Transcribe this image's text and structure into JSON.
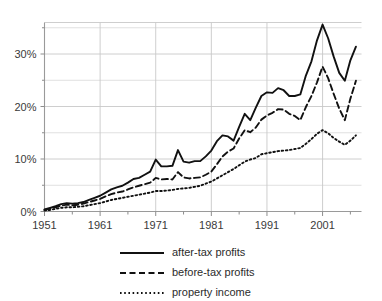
{
  "chart_data": {
    "type": "line",
    "title": "",
    "subtitle": "",
    "xlabel": "",
    "ylabel": "",
    "xlim": [
      1951,
      2008
    ],
    "ylim": [
      0,
      36
    ],
    "grid": true,
    "legend_position": "bottom",
    "x_tick_labels": [
      "1951",
      "1961",
      "1971",
      "1981",
      "1991",
      "2001"
    ],
    "x_ticks": [
      1951,
      1961,
      1971,
      1981,
      1991,
      2001
    ],
    "x_minor_ticks": [
      1956,
      1966,
      1976,
      1986,
      1996,
      2006
    ],
    "y_tick_labels": [
      "0%",
      "10%",
      "20%",
      "30%"
    ],
    "y_ticks": [
      0,
      10,
      20,
      30
    ],
    "y_minor_ticks": [
      5,
      15,
      25,
      35
    ],
    "x": [
      1951,
      1952,
      1953,
      1954,
      1955,
      1956,
      1957,
      1958,
      1959,
      1960,
      1961,
      1962,
      1963,
      1964,
      1965,
      1966,
      1967,
      1968,
      1969,
      1970,
      1971,
      1972,
      1973,
      1974,
      1975,
      1976,
      1977,
      1978,
      1979,
      1980,
      1981,
      1982,
      1983,
      1984,
      1985,
      1986,
      1987,
      1988,
      1989,
      1990,
      1991,
      1992,
      1993,
      1994,
      1995,
      1996,
      1997,
      1998,
      1999,
      2000,
      2001,
      2002,
      2003,
      2004,
      2005,
      2006,
      2007
    ],
    "series": [
      {
        "name": "after-tax profits",
        "style": "solid",
        "color": "#111111",
        "values": [
          0.4,
          0.7,
          1.0,
          1.4,
          1.6,
          1.5,
          1.6,
          1.8,
          2.2,
          2.6,
          3.0,
          3.6,
          4.2,
          4.6,
          4.9,
          5.5,
          6.2,
          6.4,
          7.0,
          7.6,
          9.9,
          8.6,
          8.6,
          8.7,
          11.7,
          9.5,
          9.3,
          9.6,
          9.6,
          10.5,
          11.6,
          13.4,
          14.5,
          14.3,
          13.5,
          16.1,
          18.6,
          17.4,
          19.8,
          22.0,
          22.7,
          22.6,
          23.5,
          23.1,
          22.0,
          22.0,
          22.3,
          25.9,
          28.6,
          32.6,
          35.6,
          33.0,
          29.5,
          26.4,
          24.9,
          28.8,
          31.4
        ],
        "last_value": 31.4
      },
      {
        "name": "before-tax profits",
        "style": "dashed",
        "color": "#111111",
        "values": [
          0.3,
          0.5,
          0.8,
          1.1,
          1.3,
          1.2,
          1.3,
          1.5,
          1.8,
          2.1,
          2.4,
          2.9,
          3.3,
          3.6,
          3.8,
          4.2,
          4.6,
          4.9,
          5.2,
          5.5,
          6.4,
          6.1,
          6.2,
          6.1,
          7.5,
          6.5,
          6.3,
          6.4,
          6.5,
          7.0,
          7.6,
          9.0,
          10.5,
          11.4,
          12.0,
          13.9,
          15.5,
          15.1,
          16.0,
          17.5,
          18.3,
          18.8,
          19.5,
          19.4,
          18.6,
          18.2,
          17.4,
          19.9,
          22.0,
          24.6,
          27.6,
          25.4,
          22.4,
          19.6,
          17.4,
          21.5,
          24.9
        ],
        "last_value": 24.9
      },
      {
        "name": "property income",
        "style": "dotted",
        "color": "#111111",
        "values": [
          0.2,
          0.3,
          0.5,
          0.7,
          0.8,
          0.8,
          0.9,
          1.0,
          1.2,
          1.4,
          1.6,
          1.9,
          2.2,
          2.4,
          2.6,
          2.8,
          3.0,
          3.2,
          3.4,
          3.6,
          3.9,
          3.9,
          4.0,
          4.1,
          4.3,
          4.4,
          4.5,
          4.7,
          4.9,
          5.3,
          5.7,
          6.3,
          6.9,
          7.5,
          8.1,
          8.8,
          9.5,
          9.9,
          10.2,
          10.9,
          11.1,
          11.3,
          11.5,
          11.6,
          11.7,
          11.9,
          12.1,
          12.9,
          13.8,
          14.8,
          15.5,
          14.9,
          14.0,
          13.3,
          12.7,
          13.5,
          14.5
        ],
        "last_value": 14.5
      }
    ],
    "legend": [
      {
        "label": "after-tax profits",
        "style": "solid"
      },
      {
        "label": "before-tax profits",
        "style": "dashed"
      },
      {
        "label": "property income",
        "style": "dotted"
      }
    ]
  }
}
